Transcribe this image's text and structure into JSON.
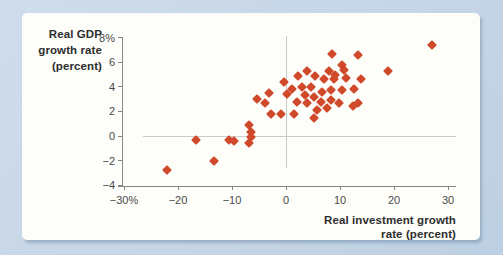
{
  "chart_data": {
    "type": "scatter",
    "title": "",
    "ylabel": "Real GDP growth rate (percent)",
    "ylabel_lines": [
      "Real GDP",
      "growth rate",
      "(percent)"
    ],
    "xlabel": "Real investment growth rate (percent)",
    "xlabel_lines": [
      "Real investment growth",
      "rate (percent)"
    ],
    "xlim": [
      -30,
      30
    ],
    "ylim": [
      -4,
      8
    ],
    "grid": "zero-lines-only",
    "legend": "none",
    "y_ticks": [
      {
        "v": 8,
        "label": "8%"
      },
      {
        "v": 6,
        "label": "6"
      },
      {
        "v": 4,
        "label": "4"
      },
      {
        "v": 2,
        "label": "2"
      },
      {
        "v": 0,
        "label": "0"
      },
      {
        "v": -2,
        "label": "−2"
      },
      {
        "v": -4,
        "label": "−4"
      }
    ],
    "x_ticks": [
      {
        "v": -30,
        "label": "−30%"
      },
      {
        "v": -20,
        "label": "−20"
      },
      {
        "v": -10,
        "label": "−10"
      },
      {
        "v": 0,
        "label": "0"
      },
      {
        "v": 10,
        "label": "10"
      },
      {
        "v": 20,
        "label": "20"
      },
      {
        "v": 30,
        "label": "30"
      }
    ],
    "marker": {
      "shape": "diamond",
      "size_px": 7,
      "color": "#d0492a"
    },
    "points": [
      [
        -22,
        -2.8
      ],
      [
        -16.6,
        -0.3
      ],
      [
        -13.3,
        -2.0
      ],
      [
        -10.6,
        -0.3
      ],
      [
        -9.7,
        -0.4
      ],
      [
        -6.8,
        0.9
      ],
      [
        -6.5,
        0.3
      ],
      [
        -6.4,
        -0.1
      ],
      [
        -6.9,
        -0.6
      ],
      [
        -5.3,
        3.0
      ],
      [
        -3.8,
        2.7
      ],
      [
        -3.2,
        3.5
      ],
      [
        -2.7,
        1.8
      ],
      [
        -1.0,
        1.8
      ],
      [
        1.5,
        1.8
      ],
      [
        -0.4,
        4.4
      ],
      [
        0.2,
        3.4
      ],
      [
        1.1,
        3.8
      ],
      [
        2.0,
        2.8
      ],
      [
        2.2,
        4.9
      ],
      [
        3.0,
        4.0
      ],
      [
        3.6,
        3.3
      ],
      [
        3.8,
        5.3
      ],
      [
        3.9,
        2.7
      ],
      [
        4.7,
        4.0
      ],
      [
        5.2,
        1.5
      ],
      [
        5.1,
        3.2
      ],
      [
        5.3,
        4.9
      ],
      [
        5.7,
        2.1
      ],
      [
        6.4,
        2.8
      ],
      [
        6.7,
        3.6
      ],
      [
        7.0,
        4.6
      ],
      [
        7.6,
        2.3
      ],
      [
        7.9,
        5.3
      ],
      [
        8.5,
        6.7
      ],
      [
        8.3,
        3.7
      ],
      [
        8.3,
        2.9
      ],
      [
        8.9,
        4.6
      ],
      [
        9.1,
        5.0
      ],
      [
        9.8,
        2.7
      ],
      [
        10.4,
        5.8
      ],
      [
        10.7,
        5.4
      ],
      [
        10.4,
        3.7
      ],
      [
        11.1,
        4.7
      ],
      [
        12.4,
        2.4
      ],
      [
        12.5,
        3.8
      ],
      [
        13.4,
        6.6
      ],
      [
        13.4,
        2.7
      ],
      [
        13.8,
        4.6
      ],
      [
        18.8,
        5.3
      ],
      [
        27.0,
        7.4
      ]
    ]
  },
  "colors": {
    "background": "#c6d6e6",
    "panel": "#fdfdfa",
    "axis": "#858585",
    "grid": "#c8cccc",
    "tick_text": "#4a4a4a",
    "title_text": "#2e2e2e",
    "marker": "#d0492a"
  }
}
